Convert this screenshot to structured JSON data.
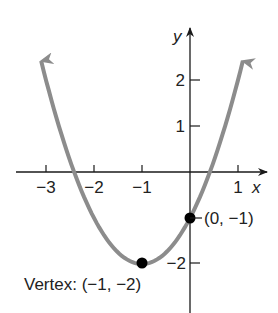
{
  "chart_data": {
    "type": "line",
    "title": "",
    "function": "y = (x + 1)^2 - 2",
    "xlabel": "x",
    "ylabel": "y",
    "xlim": [
      -3.1,
      1.1
    ],
    "ylim": [
      -2.5,
      2.5
    ],
    "grid": false,
    "x_ticks": [
      -3,
      -2,
      -1,
      1
    ],
    "x_tick_labels": [
      "−3",
      "−2",
      "−1",
      "1"
    ],
    "y_ticks": [
      2,
      1,
      -2
    ],
    "y_tick_labels": [
      "2",
      "1",
      "−2"
    ],
    "series": [
      {
        "name": "parabola",
        "color": "#8c8c8c",
        "x": [
          -3.1,
          -3,
          -2.5,
          -2,
          -1.5,
          -1,
          -0.5,
          0,
          0.5,
          1,
          1.1
        ],
        "y": [
          2.41,
          2,
          0.25,
          -1,
          -1.75,
          -2,
          -1.75,
          -1,
          0.25,
          2,
          2.41
        ]
      }
    ],
    "points": [
      {
        "x": -1,
        "y": -2,
        "label": "Vertex: (−1, −2)"
      },
      {
        "x": 0,
        "y": -1,
        "label": "(0, −1)"
      }
    ],
    "annotations": [
      "Vertex: (−1, −2)",
      "(0, −1)"
    ]
  },
  "labels": {
    "x_axis": "x",
    "y_axis": "y",
    "vertex": "Vertex: (−1, −2)",
    "intercept": "(0, −1)"
  },
  "colors": {
    "curve": "#8c8c8c",
    "axis": "#1a1a1a",
    "point": "#000000"
  }
}
